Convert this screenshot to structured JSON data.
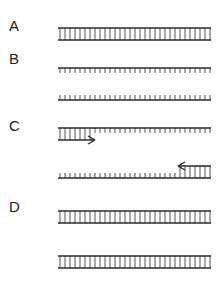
{
  "diagram": {
    "stroke_color": "#2a2a2a",
    "x_start": 58,
    "x_end": 211,
    "rung_spacing": 5,
    "panels": [
      {
        "label": "A",
        "label_y": 18,
        "description": "Double-stranded DNA template",
        "type": "double",
        "top_y": 28,
        "bottom_y": 40
      },
      {
        "label": "B",
        "label_y": 51,
        "description": "Denatured single strands",
        "type": "separated",
        "strand1_y": 68,
        "strand1_ticks": "down",
        "strand2_y": 100,
        "strand2_ticks": "up",
        "tick_len": 5
      },
      {
        "label": "C",
        "label_y": 118,
        "description": "Primers annealed to single strands",
        "type": "primed",
        "strand1_y": 128,
        "strand1_ticks": "down",
        "primer1_y": 140,
        "primer1_x1": 58,
        "primer1_x2": 95,
        "primer1_direction": "right",
        "strand2_y": 178,
        "strand2_ticks": "up",
        "primer2_y": 166,
        "primer2_x1": 178,
        "primer2_x2": 211,
        "primer2_direction": "left",
        "tick_len": 5
      },
      {
        "label": "D",
        "label_y": 199,
        "description": "Two double-stranded copies after extension",
        "type": "two-double",
        "ladder1_top_y": 211,
        "ladder1_bottom_y": 223,
        "ladder2_top_y": 256,
        "ladder2_bottom_y": 268
      }
    ]
  }
}
